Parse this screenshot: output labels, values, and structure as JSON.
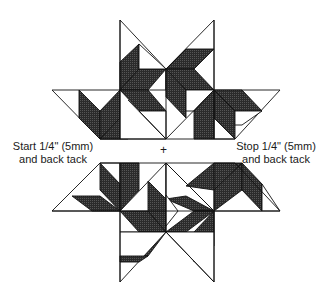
{
  "diagram": {
    "type": "quilt-star-assembly",
    "colors": {
      "fill_dark": "#2b2b2b",
      "fill_light": "#ffffff",
      "stroke": "#111111"
    },
    "labels": {
      "start_line1": "Start 1/4\" (5mm)",
      "start_line2": "and back tack",
      "stop_line1": "Stop 1/4\" (5mm)",
      "stop_line2": "and back tack",
      "center_mark": "+"
    },
    "sections": [
      {
        "name": "upper-half",
        "position": "top"
      },
      {
        "name": "lower-half",
        "position": "bottom"
      }
    ]
  }
}
